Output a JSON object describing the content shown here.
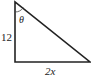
{
  "diagram": {
    "type": "right-triangle",
    "labels": {
      "angle": "θ",
      "vertical_side": "12",
      "horizontal_side": "2x"
    },
    "vertices": {
      "top": [
        15,
        2
      ],
      "right_angle": [
        15,
        62
      ],
      "bottom_right": [
        90,
        62
      ]
    },
    "colors": {
      "stroke": "#222222",
      "background": "#ffffff"
    }
  }
}
